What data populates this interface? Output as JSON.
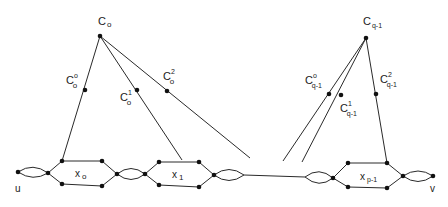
{
  "diagram": {
    "type": "graph",
    "labels": {
      "c0": "C",
      "c0_sub": "o",
      "c0_0": "C",
      "c0_0_sup": "o",
      "c0_0_sub": "o",
      "c0_1": "C",
      "c0_1_sup": "1",
      "c0_1_sub": "o",
      "c0_2": "C",
      "c0_2_sup": "2",
      "c0_2_sub": "o",
      "cq": "C",
      "cq_sub": "q-1",
      "cq_0": "C",
      "cq_0_sup": "o",
      "cq_0_sub": "q-1",
      "cq_1": "C",
      "cq_1_sup": "1",
      "cq_1_sub": "q-1",
      "cq_2": "C",
      "cq_2_sup": "2",
      "cq_2_sub": "q-1",
      "x0": "x",
      "x0_sub": "o",
      "x1": "x",
      "x1_sub": "1",
      "xp": "x",
      "xp_sub": "p-1",
      "u": "u",
      "v": "v"
    },
    "colors": {
      "stroke": "#2a2a2a",
      "node": "#111111",
      "background": "#ffffff"
    }
  }
}
